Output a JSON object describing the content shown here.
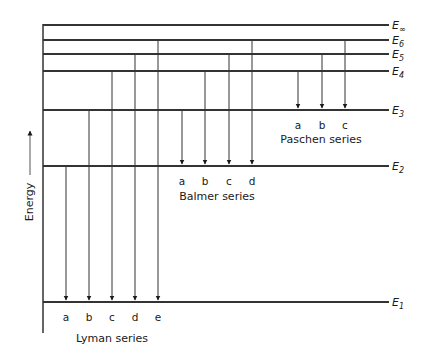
{
  "diagram": {
    "axis_label": "Energy",
    "levels": [
      {
        "id": "Einf",
        "base": "E",
        "sub": "∞",
        "y": 25
      },
      {
        "id": "E6",
        "base": "E",
        "sub": "6",
        "y": 40
      },
      {
        "id": "E5",
        "base": "E",
        "sub": "5",
        "y": 54
      },
      {
        "id": "E4",
        "base": "E",
        "sub": "4",
        "y": 71
      },
      {
        "id": "E3",
        "base": "E",
        "sub": "3",
        "y": 110
      },
      {
        "id": "E2",
        "base": "E",
        "sub": "2",
        "y": 166
      },
      {
        "id": "E1",
        "base": "E",
        "sub": "1",
        "y": 302
      }
    ],
    "series": [
      {
        "name": "Lyman series",
        "target": "E1",
        "transitions": [
          {
            "label": "a",
            "from": "E2",
            "x": 66
          },
          {
            "label": "b",
            "from": "E3",
            "x": 89
          },
          {
            "label": "c",
            "from": "E4",
            "x": 112
          },
          {
            "label": "d",
            "from": "E5",
            "x": 135
          },
          {
            "label": "e",
            "from": "E6",
            "x": 158
          }
        ],
        "label_x": 112,
        "label_y": 342
      },
      {
        "name": "Balmer series",
        "target": "E2",
        "transitions": [
          {
            "label": "a",
            "from": "E3",
            "x": 182
          },
          {
            "label": "b",
            "from": "E4",
            "x": 205
          },
          {
            "label": "c",
            "from": "E5",
            "x": 229
          },
          {
            "label": "d",
            "from": "E6",
            "x": 252
          }
        ],
        "label_x": 217,
        "label_y": 200
      },
      {
        "name": "Paschen series",
        "target": "E3",
        "transitions": [
          {
            "label": "a",
            "from": "E4",
            "x": 298
          },
          {
            "label": "b",
            "from": "E5",
            "x": 322
          },
          {
            "label": "c",
            "from": "E6",
            "x": 345
          }
        ],
        "label_x": 321,
        "label_y": 143
      }
    ]
  }
}
